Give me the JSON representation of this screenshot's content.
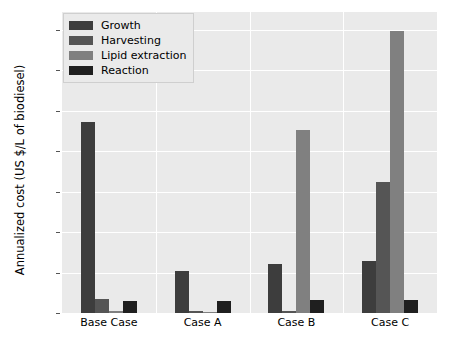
{
  "chart_data": {
    "type": "bar",
    "title": "",
    "xlabel": "",
    "ylabel": "Annualized cost (US $/L of biodiesel)",
    "categories": [
      "Base Case",
      "Case A",
      "Case B",
      "Case C"
    ],
    "series": [
      {
        "name": "Growth",
        "color": "#3d3d3d",
        "values": [
          11.8,
          2.6,
          3.0,
          3.2
        ]
      },
      {
        "name": "Harvesting",
        "color": "#555555",
        "values": [
          0.85,
          0.15,
          0.1,
          8.1
        ]
      },
      {
        "name": "Lipid extraction",
        "color": "#808080",
        "values": [
          0.1,
          0.05,
          11.3,
          17.4
        ]
      },
      {
        "name": "Reaction",
        "color": "#1f1f1f",
        "values": [
          0.75,
          0.75,
          0.8,
          0.8
        ]
      }
    ],
    "ylim": [
      0,
      18.6
    ],
    "yticks": [
      0.0,
      2.5,
      5.0,
      7.5,
      10.0,
      12.5,
      15.0,
      17.5
    ],
    "ytick_labels": [
      "0.0",
      "2.5",
      "5.0",
      "7.5",
      "10.0",
      "12.5",
      "15.0",
      "17.5"
    ],
    "grid": true,
    "grid_color": "#ffffff",
    "plot_background": "#eaeaea",
    "legend_position": "upper left",
    "legend_entries": [
      "Growth",
      "Harvesting",
      "Lipid extraction",
      "Reaction"
    ]
  }
}
